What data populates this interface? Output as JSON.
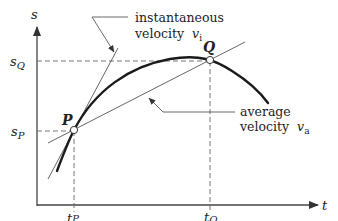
{
  "diagram": {
    "axes": {
      "y_label": "s",
      "x_label": "t"
    },
    "points": {
      "P": {
        "label": "P",
        "t_label_base": "t",
        "t_label_sub": "P",
        "s_label_base": "s",
        "s_label_sub": "P"
      },
      "Q": {
        "label": "Q",
        "t_label_base": "t",
        "t_label_sub": "Q",
        "s_label_base": "s",
        "s_label_sub": "Q"
      }
    },
    "annotations": {
      "instantaneous": {
        "line1": "instantaneous",
        "line2_text": "velocity",
        "line2_symbol": "v",
        "line2_sub": "i"
      },
      "average": {
        "line1": "average",
        "line2_text": "velocity",
        "line2_symbol": "v",
        "line2_sub": "a"
      }
    },
    "colors": {
      "curve": "#1a1a1a",
      "lines": "#555555",
      "dashed": "#666666",
      "text": "#222222"
    }
  }
}
